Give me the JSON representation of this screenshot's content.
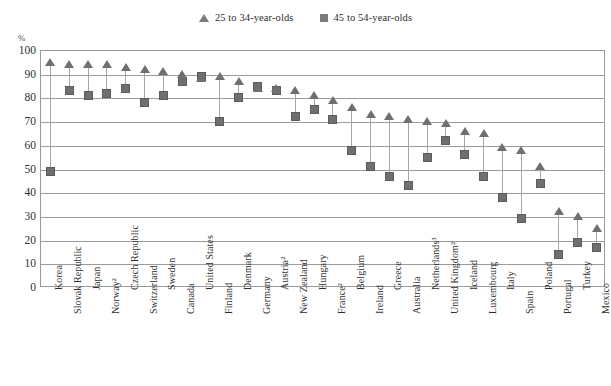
{
  "legend": {
    "position": "top-center",
    "entries": [
      {
        "label": "25 to 34-year-olds",
        "marker": "triangle-icon",
        "color": "#7a7a7a"
      },
      {
        "label": "45 to 54-year-olds",
        "marker": "square-icon",
        "color": "#7a7a7a"
      }
    ]
  },
  "axis": {
    "unit": "%",
    "ylabel": "",
    "xlabel": ""
  },
  "chart_data": {
    "type": "scatter",
    "title": "",
    "subtitle": "",
    "xlabel": "",
    "ylabel": "%",
    "ylim": [
      0,
      100
    ],
    "ytick_step": 10,
    "yticks": [
      0,
      10,
      20,
      30,
      40,
      50,
      60,
      70,
      80,
      90,
      100
    ],
    "grid": true,
    "legend_position": "top-center",
    "categories": [
      "Korea",
      "Slovak Republic",
      "Japan",
      "Norway²",
      "Czech Republic",
      "Switzerland",
      "Sweden",
      "Canada",
      "United States",
      "Finland",
      "Denmark",
      "Germany",
      "Austria²",
      "New Zealand",
      "Hungary",
      "France²",
      "Belgium",
      "Ireland",
      "Greece",
      "Australia",
      "Netherlands³",
      "United Kingdom²",
      "Iceland",
      "Luxembourg",
      "Italy",
      "Spain",
      "Poland",
      "Portugal",
      "Turkey",
      "Mexico"
    ],
    "series": [
      {
        "name": "25 to 34-year-olds",
        "marker": "triangle",
        "color": "#6f6f6f",
        "values": [
          95,
          94,
          94,
          94,
          93,
          92,
          91,
          90,
          88,
          89,
          87,
          84,
          84,
          83,
          81,
          79,
          76,
          73,
          72,
          71,
          70,
          69,
          66,
          65,
          59,
          58,
          51,
          32,
          30,
          25
        ]
      },
      {
        "name": "45 to 54-year-olds",
        "marker": "square",
        "color": "#6f6f6f",
        "values": [
          49,
          83,
          81,
          82,
          84,
          78,
          81,
          87,
          89,
          70,
          80,
          85,
          83,
          72,
          75,
          71,
          58,
          51,
          47,
          43,
          55,
          62,
          56,
          47,
          38,
          29,
          44,
          14,
          19,
          17
        ]
      }
    ]
  }
}
